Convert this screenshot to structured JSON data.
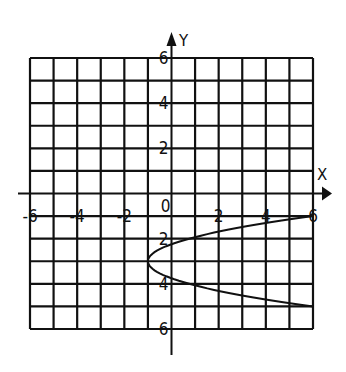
{
  "chart_data": {
    "type": "line",
    "title": "",
    "xlabel": "X",
    "ylabel": "Y",
    "xlim": [
      -6,
      6
    ],
    "ylim": [
      -6,
      6
    ],
    "grid": true,
    "grid_step": 1,
    "x_tick_labels": [
      "-6",
      "-4",
      "-2",
      "0",
      "2",
      "4",
      "6"
    ],
    "x_tick_values": [
      -6,
      -4,
      -2,
      0,
      2,
      4,
      6
    ],
    "y_tick_labels_upper": [
      "6",
      "4",
      "2"
    ],
    "y_tick_values_upper": [
      6,
      4,
      2
    ],
    "y_tick_labels_lower": [
      "2",
      "4",
      "6"
    ],
    "y_tick_values_lower": [
      -2,
      -4,
      -6
    ],
    "series": [
      {
        "name": "parabola opening right",
        "equation": "x = (7/4)(y+3)^2 - 1",
        "vertex": [
          -1,
          -3
        ],
        "points": [
          {
            "x": 6,
            "y": -1
          },
          {
            "x": 0,
            "y": -2.24
          },
          {
            "x": -1,
            "y": -3
          },
          {
            "x": 0,
            "y": -3.76
          },
          {
            "x": 6,
            "y": -5
          }
        ]
      }
    ],
    "colors": {
      "ink": "#111111",
      "background": "#ffffff"
    }
  }
}
